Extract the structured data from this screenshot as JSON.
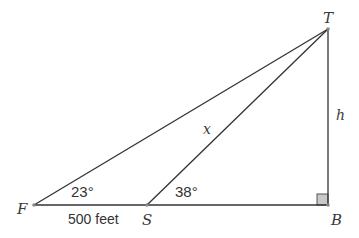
{
  "diagram": {
    "type": "right-triangle-geometry",
    "points": {
      "F": {
        "label": "F",
        "x": 34,
        "y": 205
      },
      "S": {
        "label": "S",
        "x": 147,
        "y": 205
      },
      "B": {
        "label": "B",
        "x": 328,
        "y": 205
      },
      "T": {
        "label": "T",
        "x": 328,
        "y": 29
      }
    },
    "segments": [
      {
        "from": "F",
        "to": "T"
      },
      {
        "from": "S",
        "to": "T"
      },
      {
        "from": "F",
        "to": "B"
      },
      {
        "from": "T",
        "to": "B"
      }
    ],
    "labels": {
      "angle_F": "23°",
      "angle_S": "38°",
      "FS_length": "500 feet",
      "ST_var": "x",
      "TB_var": "h"
    },
    "right_angle_at": "B",
    "colors": {
      "line": "#333333",
      "right_angle_fill": "#c8c8c8"
    }
  }
}
